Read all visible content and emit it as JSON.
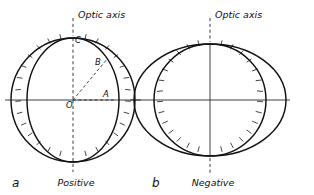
{
  "figure": {
    "type": "optical-indicatrix-diagram",
    "background_color": "#ffffff",
    "ink_color": "#111111",
    "panels": [
      {
        "id": "a",
        "panel_label": "a",
        "caption": "Positive",
        "axis_label": "Optic axis",
        "center_x": 73,
        "center_y": 100,
        "sphere": {
          "shape": "circle",
          "rx": 62,
          "ry": 62,
          "hatched": true,
          "hatch_side": "inward",
          "hatch_count": 44
        },
        "indicatrix": {
          "shape": "ellipse",
          "rx": 46,
          "ry": 62,
          "form": "prolate"
        },
        "points": [
          {
            "label": "O",
            "role": "center",
            "x": 66,
            "y": 108
          },
          {
            "label": "A",
            "role": "semi-minor-axis-end",
            "x": 107,
            "y": 95
          },
          {
            "label": "B",
            "role": "intermediate-radius",
            "x": 98,
            "y": 64
          },
          {
            "label": "C",
            "role": "optic-axis-end",
            "x": 77,
            "y": 41
          }
        ],
        "rays": [
          {
            "from": "O",
            "to": "A",
            "style": "dashed",
            "direction": "horizontal"
          },
          {
            "from": "O",
            "to": "B",
            "style": "dashed",
            "direction": "diagonal"
          },
          {
            "from": "O",
            "to": "C",
            "style": "dashed",
            "direction": "vertical"
          }
        ]
      },
      {
        "id": "b",
        "panel_label": "b",
        "caption": "Negative",
        "axis_label": "Optic axis",
        "center_x": 210,
        "center_y": 100,
        "sphere": {
          "shape": "circle",
          "rx": 56,
          "ry": 56,
          "hatched": true,
          "hatch_side": "outward",
          "hatch_count": 44
        },
        "indicatrix": {
          "shape": "ellipse",
          "rx": 76,
          "ry": 56,
          "form": "oblate"
        },
        "points": [],
        "rays": [
          {
            "from": "center",
            "to": "top",
            "style": "solid",
            "direction": "vertical"
          },
          {
            "from": "center",
            "to": "horizontal",
            "style": "solid",
            "direction": "horizontal"
          }
        ]
      }
    ]
  },
  "labels": {
    "optic_axis_a": "Optic axis",
    "optic_axis_b": "Optic axis",
    "caption_a": "Positive",
    "caption_b": "Negative",
    "panel_a": "a",
    "panel_b": "b",
    "point_O": "O",
    "point_A": "A",
    "point_B": "B",
    "point_C": "C"
  }
}
